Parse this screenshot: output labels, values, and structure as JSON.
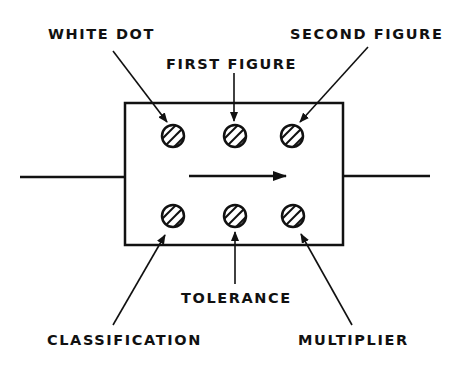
{
  "diagram": {
    "colors": {
      "ink": "#111111",
      "background": "#ffffff"
    },
    "labels": {
      "white_dot": "WHITE DOT",
      "first_figure": "FIRST FIGURE",
      "second_figure": "SECOND FIGURE",
      "tolerance": "TOLERANCE",
      "classification": "CLASSIFICATION",
      "multiplier": "MULTIPLIER"
    },
    "dots": {
      "top_row": [
        "white-dot",
        "first-figure",
        "second-figure"
      ],
      "bottom_row": [
        "classification",
        "tolerance",
        "multiplier"
      ]
    },
    "direction_arrow": "left-to-right"
  }
}
